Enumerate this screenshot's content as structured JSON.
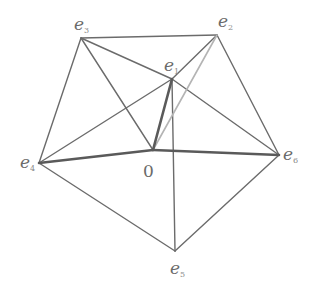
{
  "diagram": {
    "title": "",
    "vertices": [
      {
        "id": "e1",
        "base": "e",
        "sub": "1",
        "x": 172,
        "y": 79,
        "lx": 164,
        "ly": 71
      },
      {
        "id": "e2",
        "base": "e",
        "sub": "2",
        "x": 217,
        "y": 35,
        "lx": 218,
        "ly": 27
      },
      {
        "id": "e3",
        "base": "e",
        "sub": "3",
        "x": 81,
        "y": 38,
        "lx": 74,
        "ly": 30
      },
      {
        "id": "e4",
        "base": "e",
        "sub": "4",
        "x": 39,
        "y": 163,
        "lx": 20,
        "ly": 168
      },
      {
        "id": "e5",
        "base": "e",
        "sub": "5",
        "x": 175,
        "y": 251,
        "lx": 170,
        "ly": 274
      },
      {
        "id": "e6",
        "base": "e",
        "sub": "6",
        "x": 279,
        "y": 155,
        "lx": 283,
        "ly": 160
      }
    ],
    "origin": {
      "id": "O",
      "label": "0",
      "x": 153,
      "y": 150,
      "lx": 143,
      "ly": 177
    },
    "edges": [
      {
        "from": "e3",
        "to": "e2",
        "style": "normal"
      },
      {
        "from": "e2",
        "to": "e6",
        "style": "normal"
      },
      {
        "from": "e6",
        "to": "e5",
        "style": "normal"
      },
      {
        "from": "e5",
        "to": "e4",
        "style": "normal"
      },
      {
        "from": "e4",
        "to": "e3",
        "style": "normal"
      },
      {
        "from": "e3",
        "to": "O",
        "style": "normal"
      },
      {
        "from": "e3",
        "to": "e1",
        "style": "normal"
      },
      {
        "from": "e1",
        "to": "e6",
        "style": "normal"
      },
      {
        "from": "e2",
        "to": "e1",
        "style": "normal"
      },
      {
        "from": "e4",
        "to": "e1",
        "style": "normal"
      },
      {
        "from": "e1",
        "to": "e5",
        "style": "normal"
      },
      {
        "from": "e2",
        "to": "O",
        "style": "light"
      },
      {
        "from": "O",
        "to": "e1",
        "style": "thick"
      },
      {
        "from": "e4",
        "to": "O",
        "style": "thick"
      },
      {
        "from": "O",
        "to": "e6",
        "style": "thick"
      }
    ]
  },
  "colors": {
    "line": "#6b6b6b",
    "thick_line": "#5a5a5a",
    "light_line": "#b4b4b4",
    "label": "#6a6a6a",
    "background": "#ffffff"
  }
}
